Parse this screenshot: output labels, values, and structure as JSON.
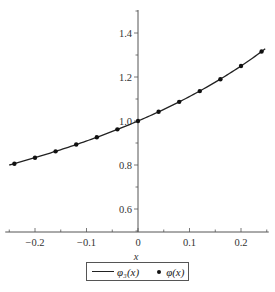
{
  "chart_data": {
    "type": "line",
    "title": "",
    "xlabel": "x",
    "ylabel": "",
    "xlim": [
      -0.25,
      0.25
    ],
    "ylim": [
      0.5,
      1.5
    ],
    "x_ticks": [
      -0.2,
      -0.1,
      0,
      0.1,
      0.2
    ],
    "x_tick_labels": [
      "−0.2",
      "−0.1",
      "0",
      "0.1",
      "0.2"
    ],
    "y_ticks": [
      0.6,
      0.8,
      1.0,
      1.2,
      1.4
    ],
    "y_tick_labels": [
      "0.6",
      "0.8",
      "1.0",
      "1.2",
      "1.4"
    ],
    "grid": false,
    "legend_position": "bottom",
    "series": [
      {
        "name": "φ3(x)",
        "style": "line",
        "x": [
          -0.24,
          -0.2,
          -0.16,
          -0.12,
          -0.08,
          -0.04,
          0.0,
          0.04,
          0.08,
          0.12,
          0.16,
          0.2,
          0.24
        ],
        "values": [
          0.806,
          0.833,
          0.862,
          0.893,
          0.926,
          0.962,
          1.0,
          1.042,
          1.087,
          1.136,
          1.19,
          1.25,
          1.316
        ]
      },
      {
        "name": "φ(x)",
        "style": "points",
        "x": [
          -0.24,
          -0.2,
          -0.16,
          -0.12,
          -0.08,
          -0.04,
          0.0,
          0.04,
          0.08,
          0.12,
          0.16,
          0.2,
          0.24
        ],
        "values": [
          0.806,
          0.833,
          0.862,
          0.893,
          0.926,
          0.962,
          1.0,
          1.042,
          1.087,
          1.136,
          1.19,
          1.25,
          1.316
        ]
      }
    ]
  },
  "legend": {
    "line_label": "φ₃(x)",
    "dot_label": "φ(x)"
  },
  "top_caption": "ε ∈ [0, 1]"
}
